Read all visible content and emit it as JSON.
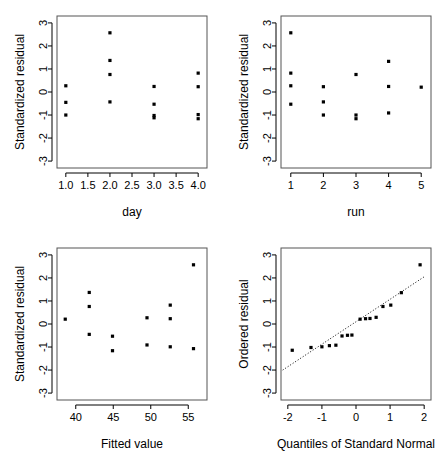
{
  "figure": {
    "title": "",
    "layout": "2x2 grid of residual diagnostic scatterplots"
  },
  "chart_data": [
    {
      "id": "residual-vs-day",
      "type": "scatter",
      "title": "",
      "xlabel": "day",
      "ylabel": "Standardized residual",
      "xlim": [
        0.8,
        4.2
      ],
      "ylim": [
        -3.3,
        3.3
      ],
      "xticks": [
        1.0,
        1.5,
        2.0,
        2.5,
        3.0,
        3.5,
        4.0
      ],
      "xticklabels": [
        "1.0",
        "1.5",
        "2.0",
        "2.5",
        "3.0",
        "3.5",
        "4.0"
      ],
      "yticks": [
        -3,
        -2,
        -1,
        0,
        1,
        2,
        3
      ],
      "yticklabels": [
        "-3",
        "-2",
        "-1",
        "0",
        "1",
        "2",
        "3"
      ],
      "grid": false,
      "legend": null,
      "points": [
        {
          "x": 1.0,
          "y": 0.27
        },
        {
          "x": 1.0,
          "y": -0.45
        },
        {
          "x": 1.0,
          "y": -1.0
        },
        {
          "x": 2.0,
          "y": 2.57
        },
        {
          "x": 2.0,
          "y": 1.37
        },
        {
          "x": 2.0,
          "y": 0.76
        },
        {
          "x": 2.0,
          "y": -0.43
        },
        {
          "x": 3.0,
          "y": 0.24
        },
        {
          "x": 3.0,
          "y": -0.53
        },
        {
          "x": 3.0,
          "y": -1.02
        },
        {
          "x": 3.0,
          "y": -1.12
        },
        {
          "x": 4.0,
          "y": 0.82
        },
        {
          "x": 4.0,
          "y": 0.23
        },
        {
          "x": 4.0,
          "y": -0.98
        },
        {
          "x": 4.0,
          "y": -1.16
        }
      ]
    },
    {
      "id": "residual-vs-run",
      "type": "scatter",
      "title": "",
      "xlabel": "run",
      "ylabel": "Standardized residual",
      "xlim": [
        0.7,
        5.3
      ],
      "ylim": [
        -3.3,
        3.3
      ],
      "xticks": [
        1,
        2,
        3,
        4,
        5
      ],
      "xticklabels": [
        "1",
        "2",
        "3",
        "4",
        "5"
      ],
      "yticks": [
        -3,
        -2,
        -1,
        0,
        1,
        2,
        3
      ],
      "yticklabels": [
        "-3",
        "-2",
        "-1",
        "0",
        "1",
        "2",
        "3"
      ],
      "grid": false,
      "legend": null,
      "points": [
        {
          "x": 1,
          "y": 2.57
        },
        {
          "x": 1,
          "y": 0.82
        },
        {
          "x": 1,
          "y": 0.27
        },
        {
          "x": 1,
          "y": -0.53
        },
        {
          "x": 2,
          "y": 0.23
        },
        {
          "x": 2,
          "y": -0.43
        },
        {
          "x": 2,
          "y": -1.0
        },
        {
          "x": 3,
          "y": 0.76
        },
        {
          "x": 3,
          "y": -1.0
        },
        {
          "x": 3,
          "y": -1.16
        },
        {
          "x": 4,
          "y": 1.33
        },
        {
          "x": 4,
          "y": 0.24
        },
        {
          "x": 4,
          "y": -0.91
        },
        {
          "x": 5,
          "y": 0.21
        }
      ]
    },
    {
      "id": "residual-vs-fitted",
      "type": "scatter",
      "title": "",
      "xlabel": "Fitted value",
      "ylabel": "Standardized residual",
      "xlim": [
        37.5,
        57.5
      ],
      "ylim": [
        -3.3,
        3.3
      ],
      "xticks": [
        40,
        45,
        50,
        55
      ],
      "xticklabels": [
        "40",
        "45",
        "50",
        "55"
      ],
      "yticks": [
        -3,
        -2,
        -1,
        0,
        1,
        2,
        3
      ],
      "yticklabels": [
        "-3",
        "-2",
        "-1",
        "0",
        "1",
        "2",
        "3"
      ],
      "grid": false,
      "legend": null,
      "points": [
        {
          "x": 38.6,
          "y": 0.21
        },
        {
          "x": 41.8,
          "y": 1.37
        },
        {
          "x": 41.8,
          "y": 0.76
        },
        {
          "x": 41.8,
          "y": -0.45
        },
        {
          "x": 44.9,
          "y": -0.53
        },
        {
          "x": 44.9,
          "y": -1.16
        },
        {
          "x": 49.5,
          "y": 0.27
        },
        {
          "x": 49.5,
          "y": -0.91
        },
        {
          "x": 52.6,
          "y": 0.82
        },
        {
          "x": 52.6,
          "y": 0.23
        },
        {
          "x": 52.6,
          "y": -0.99
        },
        {
          "x": 55.7,
          "y": 2.57
        },
        {
          "x": 55.7,
          "y": -1.07
        }
      ]
    },
    {
      "id": "normal-qq",
      "type": "scatter",
      "title": "",
      "xlabel": "Quantiles of Standard Normal",
      "ylabel": "Ordered residual",
      "xlim": [
        -2.2,
        2.2
      ],
      "ylim": [
        -3.3,
        3.3
      ],
      "xticks": [
        -2,
        -1,
        0,
        1,
        2
      ],
      "xticklabels": [
        "-2",
        "-1",
        "0",
        "1",
        "2"
      ],
      "yticks": [
        -3,
        -2,
        -1,
        0,
        1,
        2,
        3
      ],
      "yticklabels": [
        "-3",
        "-2",
        "-1",
        "0",
        "1",
        "2",
        "3"
      ],
      "grid": false,
      "legend": null,
      "reference_line": {
        "x0": -2.15,
        "y0": -2.0,
        "x1": 2.0,
        "y1": 2.05,
        "style": "dotted"
      },
      "points": [
        {
          "x": -1.87,
          "y": -1.14
        },
        {
          "x": -1.32,
          "y": -1.02
        },
        {
          "x": -1.0,
          "y": -0.99
        },
        {
          "x": -0.78,
          "y": -0.94
        },
        {
          "x": -0.59,
          "y": -0.92
        },
        {
          "x": -0.41,
          "y": -0.52
        },
        {
          "x": -0.25,
          "y": -0.49
        },
        {
          "x": -0.12,
          "y": -0.48
        },
        {
          "x": 0.12,
          "y": 0.21
        },
        {
          "x": 0.28,
          "y": 0.23
        },
        {
          "x": 0.41,
          "y": 0.24
        },
        {
          "x": 0.59,
          "y": 0.29
        },
        {
          "x": 0.79,
          "y": 0.76
        },
        {
          "x": 1.02,
          "y": 0.82
        },
        {
          "x": 1.33,
          "y": 1.36
        },
        {
          "x": 1.88,
          "y": 2.57
        }
      ]
    }
  ]
}
